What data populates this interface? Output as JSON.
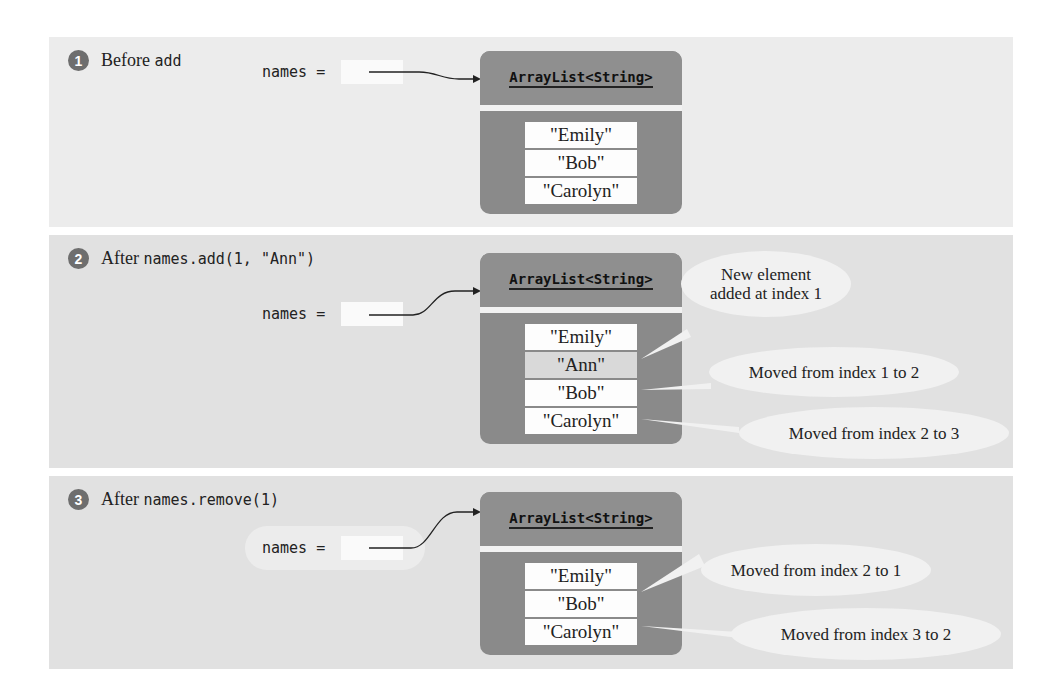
{
  "steps": [
    {
      "number": "1",
      "label_text": "Before",
      "label_code": "add",
      "variable": "names =",
      "list_type": "ArrayList<String>",
      "elements": [
        "\"Emily\"",
        "\"Bob\"",
        "\"Carolyn\""
      ],
      "callouts": []
    },
    {
      "number": "2",
      "label_text": "After",
      "label_code": "names.add(1, \"Ann\")",
      "variable": "names =",
      "list_type": "ArrayList<String>",
      "elements": [
        "\"Emily\"",
        "\"Ann\"",
        "\"Bob\"",
        "\"Carolyn\""
      ],
      "highlighted_index": 1,
      "callouts": [
        {
          "line1": "New element",
          "line2": "added at index 1",
          "points_to": "\"Ann\""
        },
        {
          "line1": "Moved from index 1 to 2",
          "points_to": "\"Bob\""
        },
        {
          "line1": "Moved from index 2 to 3",
          "points_to": "\"Carolyn\""
        }
      ]
    },
    {
      "number": "3",
      "label_text": "After",
      "label_code": "names.remove(1)",
      "variable": "names =",
      "list_type": "ArrayList<String>",
      "elements": [
        "\"Emily\"",
        "\"Bob\"",
        "\"Carolyn\""
      ],
      "callouts": [
        {
          "line1": "Moved from index 2 to 1",
          "points_to": "\"Bob\""
        },
        {
          "line1": "Moved from index 3 to 2",
          "points_to": "\"Carolyn\""
        }
      ]
    }
  ],
  "colors": {
    "panel_bg": "#e3e3e3",
    "object_bg": "#8a8a8a",
    "badge_bg": "#6e6e6e",
    "callout_bg": "#f1f1f1",
    "element_bg": "#fdfdfd",
    "highlight_bg": "#d9d9d9"
  }
}
